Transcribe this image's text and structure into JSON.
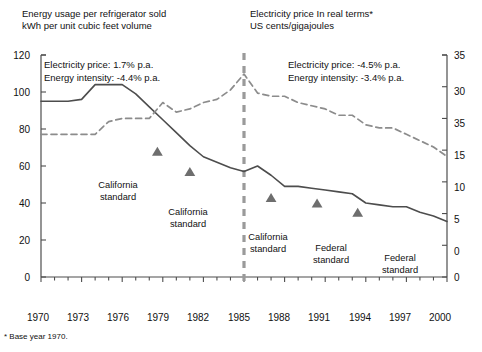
{
  "titles": {
    "left_line1": "Energy usage per refrigerator sold",
    "left_line2": "kWh per unit cubic feet volume",
    "right_line1": "Electricity price In real terms*",
    "right_line2": "US cents/gigajoules"
  },
  "footnote": "* Base year 1970.",
  "annotations": {
    "left": {
      "line1": "Electricity price: 1.7% p.a.",
      "line2": "Energy intensity: -4.4% p.a."
    },
    "right": {
      "line1": "Electricity price: -4.5% p.a.",
      "line2": "Energy intensity: -3.4% p.a."
    }
  },
  "marker_labels": {
    "m1_line1": "California",
    "m1_line2": "standard",
    "m2_line1": "California",
    "m2_line2": "standard",
    "m3_line1": "California",
    "m3_line2": "standard",
    "m4_line1": "Federal",
    "m4_line2": "standard",
    "m5_line1": "Federal",
    "m5_line2": "standard"
  },
  "colors": {
    "line_solid": "#4d4d4d",
    "line_dashed": "#8c8c8c",
    "marker": "#6e6e6e",
    "axis": "#4d4d4d",
    "divider": "#9a9a9a",
    "text": "#111111",
    "background": "#ffffff"
  },
  "chart_data": {
    "type": "line",
    "xlabel": "",
    "ylabel": "kWh per unit cubic feet volume",
    "y2label": "US cents/gigajoules",
    "xlim": [
      1970,
      2000
    ],
    "ylim": [
      0,
      120
    ],
    "y2lim": [
      0,
      35
    ],
    "grid": false,
    "legend": "none",
    "xticks": [
      1970,
      1973,
      1976,
      1979,
      1982,
      1985,
      1988,
      1991,
      1994,
      1997,
      2000
    ],
    "xtick_labels": [
      "1970",
      "1973",
      "1976",
      "1979",
      "1982",
      "1985",
      "1988",
      "1991",
      "1994",
      "1997",
      "2000"
    ],
    "xticks_minor_every": 1,
    "yticks": [
      0,
      20,
      40,
      60,
      80,
      100,
      120
    ],
    "ytick_labels": [
      "0",
      "20",
      "40",
      "60",
      "80",
      "100",
      "120"
    ],
    "y2ticks": [
      0,
      5,
      10,
      15,
      20,
      25,
      30,
      35
    ],
    "y2tick_labels": [
      "0",
      "5",
      "10",
      "15",
      "35",
      "30",
      "35"
    ],
    "x": [
      1970,
      1971,
      1972,
      1973,
      1974,
      1975,
      1976,
      1977,
      1978,
      1979,
      1980,
      1981,
      1982,
      1983,
      1984,
      1985,
      1986,
      1987,
      1988,
      1989,
      1990,
      1991,
      1992,
      1993,
      1994,
      1995,
      1996,
      1997,
      1998,
      1999,
      2000
    ],
    "series": [
      {
        "name": "Energy usage per refrigerator sold",
        "axis": "left",
        "style": "solid",
        "units": "kWh per unit cubic feet volume",
        "values": [
          95,
          95,
          95,
          96,
          104,
          104,
          104,
          99,
          92,
          85,
          78,
          71,
          65,
          62,
          59,
          57,
          60,
          55,
          49,
          49,
          48,
          47,
          46,
          45,
          40,
          39,
          38,
          38,
          35,
          33,
          30
        ]
      },
      {
        "name": "Electricity price In real terms",
        "axis": "right",
        "style": "dashed",
        "units": "US cents/gigajoules",
        "values": [
          22.5,
          22.5,
          22.5,
          22.5,
          22.5,
          24.5,
          25.0,
          25.0,
          25.0,
          27.5,
          26.0,
          26.5,
          27.5,
          28.0,
          29.5,
          32.0,
          29.0,
          28.5,
          28.5,
          27.5,
          27.0,
          26.5,
          25.5,
          25.5,
          24.0,
          23.5,
          23.5,
          22.5,
          21.5,
          20.5,
          19.0
        ]
      }
    ],
    "divider_line": {
      "x": 1985,
      "style": "dashed",
      "note": "vertical separator"
    },
    "markers": [
      {
        "label": "California standard",
        "x": 1978.6,
        "y_left": 68
      },
      {
        "label": "California standard",
        "x": 1981.0,
        "y_left": 57
      },
      {
        "label": "California standard",
        "x": 1987.0,
        "y_left": 43
      },
      {
        "label": "Federal standard",
        "x": 1990.4,
        "y_left": 40
      },
      {
        "label": "Federal standard",
        "x": 1993.4,
        "y_left": 35
      }
    ]
  }
}
